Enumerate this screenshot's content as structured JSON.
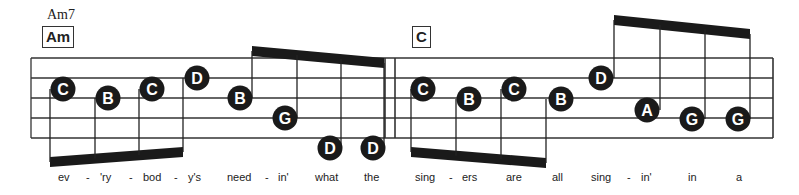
{
  "chords": {
    "measure1_top": "Am7",
    "measure1_box": "Am",
    "measure2_box": "C"
  },
  "staff": {
    "lines_y": [
      58,
      78,
      98,
      118,
      138
    ],
    "left_x": 31,
    "right_x": 773,
    "barline_x": [
      385,
      395
    ]
  },
  "notes": [
    {
      "label": "C",
      "x": 63,
      "y": 89,
      "stem_x": 50,
      "stem_dir": "down"
    },
    {
      "label": "B",
      "x": 108,
      "y": 98,
      "stem_x": 95,
      "stem_dir": "down"
    },
    {
      "label": "C",
      "x": 152,
      "y": 89,
      "stem_x": 139,
      "stem_dir": "down"
    },
    {
      "label": "D",
      "x": 197,
      "y": 78,
      "stem_x": 183,
      "stem_dir": "down"
    },
    {
      "label": "B",
      "x": 240,
      "y": 98,
      "stem_x": 252,
      "stem_dir": "up"
    },
    {
      "label": "G",
      "x": 285,
      "y": 118,
      "stem_x": 297,
      "stem_dir": "up"
    },
    {
      "label": "D",
      "x": 330,
      "y": 148,
      "stem_x": 341,
      "stem_dir": "up"
    },
    {
      "label": "D",
      "x": 373,
      "y": 148,
      "stem_x": 384,
      "stem_dir": "up"
    },
    {
      "label": "C",
      "x": 423,
      "y": 89,
      "stem_x": 411,
      "stem_dir": "down"
    },
    {
      "label": "B",
      "x": 469,
      "y": 99,
      "stem_x": 456,
      "stem_dir": "down"
    },
    {
      "label": "C",
      "x": 514,
      "y": 89,
      "stem_x": 501,
      "stem_dir": "down"
    },
    {
      "label": "B",
      "x": 561,
      "y": 99,
      "stem_x": 546,
      "stem_dir": "down"
    },
    {
      "label": "D",
      "x": 601,
      "y": 78,
      "stem_x": 614,
      "stem_dir": "up"
    },
    {
      "label": "A",
      "x": 647,
      "y": 110,
      "stem_x": 660,
      "stem_dir": "up"
    },
    {
      "label": "G",
      "x": 692,
      "y": 119,
      "stem_x": 705,
      "stem_dir": "up"
    },
    {
      "label": "G",
      "x": 738,
      "y": 119,
      "stem_x": 750,
      "stem_dir": "up"
    }
  ],
  "beams": [
    {
      "x1": 50,
      "y1": 162,
      "x2": 183,
      "y2": 152
    },
    {
      "x1": 252,
      "y1": 51,
      "x2": 384,
      "y2": 63
    },
    {
      "x1": 411,
      "y1": 152,
      "x2": 546,
      "y2": 163
    },
    {
      "x1": 614,
      "y1": 20,
      "x2": 750,
      "y2": 34
    }
  ],
  "lyrics": [
    {
      "text": "ev",
      "x": 58
    },
    {
      "text": "-",
      "x": 86
    },
    {
      "text": "'ry",
      "x": 100
    },
    {
      "text": "-",
      "x": 129
    },
    {
      "text": "bod",
      "x": 143
    },
    {
      "text": "-",
      "x": 174
    },
    {
      "text": "y's",
      "x": 188
    },
    {
      "text": "need",
      "x": 227
    },
    {
      "text": "-",
      "x": 265
    },
    {
      "text": "in'",
      "x": 278
    },
    {
      "text": "what",
      "x": 315
    },
    {
      "text": "the",
      "x": 364
    },
    {
      "text": "sing",
      "x": 415
    },
    {
      "text": "-",
      "x": 449
    },
    {
      "text": "ers",
      "x": 462
    },
    {
      "text": "are",
      "x": 506
    },
    {
      "text": "all",
      "x": 552
    },
    {
      "text": "sing",
      "x": 591
    },
    {
      "text": "-",
      "x": 627
    },
    {
      "text": "in'",
      "x": 641
    },
    {
      "text": "in",
      "x": 688
    },
    {
      "text": "a",
      "x": 736
    }
  ]
}
